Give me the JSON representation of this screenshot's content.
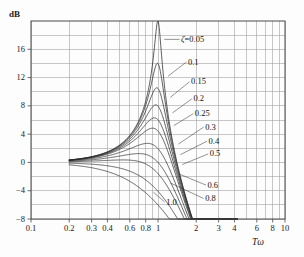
{
  "chart_data": {
    "type": "line",
    "title": "",
    "subtitle": "",
    "xlabel": "Tω",
    "ylabel": "dB",
    "xscale": "log",
    "xlim": [
      0.1,
      10
    ],
    "ylim": [
      -8,
      20
    ],
    "grid": true,
    "legend_position": "inline-annotations",
    "y_ticks": [
      {
        "value": 16,
        "label": "16"
      },
      {
        "value": 12,
        "label": "12"
      },
      {
        "value": 8,
        "label": "8"
      },
      {
        "value": 4,
        "label": "4"
      },
      {
        "value": 0,
        "label": "0"
      },
      {
        "value": -4,
        "label": "−4"
      },
      {
        "value": -8,
        "label": "−8"
      }
    ],
    "y_gridlines": [
      18,
      16,
      14,
      12,
      10,
      8,
      6,
      4,
      2,
      0,
      -2,
      -4,
      -6,
      -8
    ],
    "x_ticks": [
      {
        "value": 0.1,
        "label": "0.1"
      },
      {
        "value": 0.2,
        "label": "0.2"
      },
      {
        "value": 0.3,
        "label": "0.3"
      },
      {
        "value": 0.4,
        "label": "0.4"
      },
      {
        "value": 0.6,
        "label": "0.6"
      },
      {
        "value": 0.8,
        "label": "0.8"
      },
      {
        "value": 1,
        "label": "1"
      },
      {
        "value": 2,
        "label": "2"
      },
      {
        "value": 3,
        "label": "3"
      },
      {
        "value": 4,
        "label": "4"
      },
      {
        "value": 6,
        "label": "6"
      },
      {
        "value": 8,
        "label": "8"
      },
      {
        "value": 10,
        "label": "10"
      }
    ],
    "x_gridlines": [
      0.1,
      0.2,
      0.3,
      0.4,
      0.5,
      0.6,
      0.7,
      0.8,
      0.9,
      1,
      2,
      3,
      4,
      5,
      6,
      7,
      8,
      9,
      10
    ],
    "curve_domain": [
      0.2,
      4.2
    ],
    "series": [
      {
        "name": "ζ=0.05",
        "zeta": 0.05,
        "peak_db": 20.0,
        "peak_at": 0.9987
      },
      {
        "name": "0.1",
        "zeta": 0.1,
        "peak_db": 14.0,
        "peak_at": 0.995
      },
      {
        "name": "0.15",
        "zeta": 0.15,
        "peak_db": 10.5,
        "peak_at": 0.9886
      },
      {
        "name": "0.2",
        "zeta": 0.2,
        "peak_db": 8.1,
        "peak_at": 0.9798
      },
      {
        "name": "0.25",
        "zeta": 0.25,
        "peak_db": 6.3,
        "peak_at": 0.9682
      },
      {
        "name": "0.3",
        "zeta": 0.3,
        "peak_db": 4.85,
        "peak_at": 0.9539
      },
      {
        "name": "0.4",
        "zeta": 0.4,
        "peak_db": 2.69,
        "peak_at": 0.9165
      },
      {
        "name": "0.5",
        "zeta": 0.5,
        "peak_db": 1.25,
        "peak_at": 0.866
      },
      {
        "name": "0.6",
        "zeta": 0.6,
        "peak_db": 0.35,
        "peak_at": 0.8
      },
      {
        "name": "0.8",
        "zeta": 0.8,
        "peak_db": -3.9,
        "peak_at": 1.0
      },
      {
        "name": "1.0",
        "zeta": 1.0,
        "peak_db": -6.0,
        "peak_at": 1.0
      }
    ],
    "annotations": [
      {
        "text": "ζ=0.05",
        "zeta_prefix": true,
        "x_db": 1.52,
        "y_db": 17.4,
        "anchor_x": 1.12,
        "anchor_y": 17.4
      },
      {
        "text": "0.1",
        "x_db": 1.72,
        "y_db": 14.2,
        "anchor_x": 1.2,
        "anchor_y": 12.2
      },
      {
        "text": "0.15",
        "x_db": 1.82,
        "y_db": 11.4,
        "anchor_x": 1.25,
        "anchor_y": 9.2
      },
      {
        "text": "0.2",
        "x_db": 1.9,
        "y_db": 9.0,
        "anchor_x": 1.3,
        "anchor_y": 7.0
      },
      {
        "text": "0.25",
        "x_db": 1.95,
        "y_db": 6.9,
        "anchor_x": 1.33,
        "anchor_y": 5.2
      },
      {
        "text": "0.3",
        "x_db": 2.35,
        "y_db": 5.0,
        "anchor_x": 1.45,
        "anchor_y": 2.6
      },
      {
        "text": "0.4",
        "x_db": 2.5,
        "y_db": 3.0,
        "anchor_x": 1.5,
        "anchor_y": 1.1
      },
      {
        "text": "0.5",
        "x_db": 2.55,
        "y_db": 1.2,
        "anchor_x": 1.55,
        "anchor_y": -0.3
      },
      {
        "text": "0.6",
        "x_db": 2.45,
        "y_db": -3.2,
        "anchor_x": 1.45,
        "anchor_y": -1.6
      },
      {
        "text": "0.8",
        "x_db": 2.35,
        "y_db": -5.1,
        "anchor_x": 1.25,
        "anchor_y": -2.9
      },
      {
        "text": "1.0",
        "x_db": 1.16,
        "y_db": -5.6,
        "anchor_x": 0.92,
        "anchor_y": -4.2
      }
    ],
    "colors": {
      "curve": "#2b2b2b",
      "grid": "#9a9a9a",
      "axis": "#4a4a4a",
      "background": "#fdfdfd",
      "text": "#1a1a1a"
    }
  }
}
